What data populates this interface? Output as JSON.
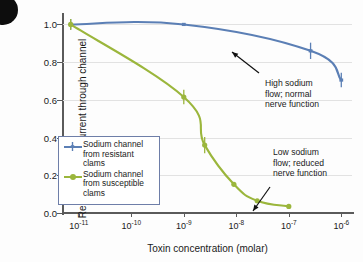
{
  "figure": {
    "corner_marker": "black-circle-bullet"
  },
  "chart_data": {
    "type": "line",
    "title": "",
    "xlabel": "Toxin concentration (molar)",
    "ylabel": "Relative sodium current through channel",
    "xscale": "log",
    "xlim": [
      5e-12,
      1.6e-06
    ],
    "ylim": [
      0.0,
      1.05
    ],
    "yticks": [
      "1.0",
      "0.8",
      "0.6",
      "0.4",
      "0.2",
      "0.0"
    ],
    "ytick_values": [
      1.0,
      0.8,
      0.6,
      0.4,
      0.2,
      0.0
    ],
    "xticks": [
      {
        "mantissa": "10",
        "exponent": "-11",
        "value": 1e-11
      },
      {
        "mantissa": "10",
        "exponent": "-10",
        "value": 1e-10
      },
      {
        "mantissa": "10",
        "exponent": "-9",
        "value": 1e-09
      },
      {
        "mantissa": "10",
        "exponent": "-8",
        "value": 1e-08
      },
      {
        "mantissa": "10",
        "exponent": "-7",
        "value": 1e-07
      },
      {
        "mantissa": "10",
        "exponent": "-6",
        "value": 1e-06
      }
    ],
    "grid": "horizontal",
    "legend_position": "center-left",
    "series": [
      {
        "name": "Sodium channel from resistant clams",
        "color": "#5b7fb5",
        "marker": "error-bar",
        "x": [
          7e-12,
          1e-09,
          2.6e-07,
          1e-06
        ],
        "y": [
          1.0,
          1.0,
          0.86,
          0.705
        ],
        "yerr": [
          0.015,
          0.0,
          0.03,
          0.025
        ]
      },
      {
        "name": "Sodium channel from susceptible clams",
        "color": "#9bb63c",
        "marker": "circle",
        "x": [
          7e-12,
          1e-09,
          2.5e-09,
          9e-09,
          2.5e-08,
          1e-07
        ],
        "y": [
          1.0,
          0.615,
          0.36,
          0.152,
          0.065,
          0.035
        ],
        "yerr": [
          0.015,
          0.025,
          0.03,
          0.0,
          0.0,
          0.0
        ]
      }
    ],
    "annotations": [
      {
        "name": "high-sodium-annotation",
        "text": "High sodium\nflow; normal\nnerve function",
        "arrow": "up-left"
      },
      {
        "name": "low-sodium-annotation",
        "text": "Low sodium\nflow; reduced\nnerve function",
        "arrow": "down-left"
      }
    ]
  },
  "legend": {
    "items": [
      {
        "label": "Sodium channel\nfrom resistant\nclams",
        "color": "#5b7fb5",
        "marker": "error-bar"
      },
      {
        "label": "Sodium channel\nfrom susceptible\nclams",
        "color": "#9bb63c",
        "marker": "circle"
      }
    ]
  }
}
